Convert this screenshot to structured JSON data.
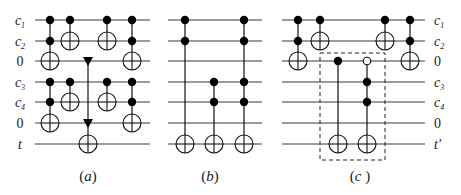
{
  "wires": {
    "y": [
      20,
      41,
      61,
      82,
      102,
      123,
      144
    ],
    "left_labels": [
      {
        "base": "c",
        "sub": "1",
        "italic": true
      },
      {
        "base": "c",
        "sub": "2",
        "italic": true
      },
      {
        "base": "0",
        "sub": "",
        "italic": false
      },
      {
        "base": "c",
        "sub": "3",
        "italic": true
      },
      {
        "base": "c",
        "sub": "4",
        "italic": true
      },
      {
        "base": "0",
        "sub": "",
        "italic": false
      },
      {
        "base": "t",
        "sub": "",
        "italic": true
      }
    ],
    "right_labels": [
      {
        "base": "c",
        "sub": "1",
        "italic": true
      },
      {
        "base": "c",
        "sub": "2",
        "italic": true
      },
      {
        "base": "0",
        "sub": "",
        "italic": false
      },
      {
        "base": "c",
        "sub": "3",
        "italic": true
      },
      {
        "base": "c",
        "sub": "4",
        "italic": true
      },
      {
        "base": "0",
        "sub": "",
        "italic": false
      },
      {
        "base": "t′",
        "sub": "",
        "italic": true
      }
    ]
  },
  "panels": [
    {
      "id": "a",
      "caption": "(a)",
      "caption_x": 88,
      "x_start": 35,
      "x_end": 150,
      "gates": [
        {
          "x": 50,
          "controls": [
            0,
            1
          ],
          "target": 2
        },
        {
          "x": 70,
          "controls": [
            0
          ],
          "target": 1
        },
        {
          "x": 50,
          "controls": [
            3,
            4
          ],
          "target": 5
        },
        {
          "x": 70,
          "controls": [
            3
          ],
          "target": 4
        },
        {
          "x": 88,
          "triangles": [
            2,
            5
          ],
          "target": 6
        },
        {
          "x": 107,
          "controls": [
            0
          ],
          "target": 1
        },
        {
          "x": 107,
          "controls": [
            3
          ],
          "target": 4
        },
        {
          "x": 132,
          "controls": [
            0,
            1
          ],
          "target": 2
        },
        {
          "x": 132,
          "controls": [
            3,
            4
          ],
          "target": 5
        }
      ]
    },
    {
      "id": "b",
      "caption": "(b)",
      "caption_x": 210,
      "x_start": 168,
      "x_end": 262,
      "gates": [
        {
          "x": 185,
          "controls": [
            0,
            1
          ],
          "target": 6
        },
        {
          "x": 214,
          "controls": [
            3,
            4
          ],
          "target": 6
        },
        {
          "x": 244,
          "controls": [
            0,
            1,
            3,
            4
          ],
          "target": 6
        }
      ]
    },
    {
      "id": "c",
      "caption": "(c )",
      "caption_x": 360,
      "x_start": 282,
      "x_end": 425,
      "dashed_box": {
        "x": 320,
        "y": 53,
        "w": 65,
        "h": 107
      },
      "gates": [
        {
          "x": 298,
          "controls": [
            0,
            1
          ],
          "target": 2
        },
        {
          "x": 320,
          "controls": [
            0
          ],
          "target": 1
        },
        {
          "x": 338,
          "controls": [
            2
          ],
          "target": 6
        },
        {
          "x": 367,
          "open_controls": [
            2
          ],
          "controls": [
            3,
            4
          ],
          "target": 6
        },
        {
          "x": 385,
          "controls": [
            0
          ],
          "target": 1
        },
        {
          "x": 410,
          "controls": [
            0,
            1
          ],
          "target": 2
        }
      ]
    }
  ]
}
